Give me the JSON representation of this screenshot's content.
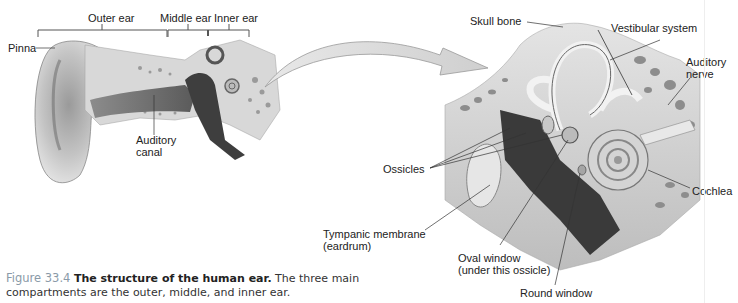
{
  "figure": {
    "number_label": "Figure 33.4",
    "title": "The structure of the human ear.",
    "description": "The three main compartments are the outer, middle, and inner ear."
  },
  "left_panel": {
    "compartments": [
      {
        "label": "Outer ear"
      },
      {
        "label": "Middle ear"
      },
      {
        "label": "Inner ear"
      }
    ],
    "labels": {
      "pinna": "Pinna",
      "auditory_canal_line1": "Auditory",
      "auditory_canal_line2": "canal"
    }
  },
  "right_panel": {
    "labels": {
      "skull_bone": "Skull bone",
      "vestibular_system": "Vestibular system",
      "auditory_nerve_line1": "Auditory",
      "auditory_nerve_line2": "nerve",
      "ossicles": "Ossicles",
      "cochlea": "Cochlea",
      "tympanic_line1": "Tympanic membrane",
      "tympanic_line2": "(eardrum)",
      "oval_window_line1": "Oval window",
      "oval_window_line2": "(under this ossicle)",
      "round_window": "Round window"
    }
  },
  "icons": {
    "zoom_arrow": "curved-arrow-icon"
  },
  "colors": {
    "tissue_light": "#d9d9d9",
    "tissue_mid": "#a8a8a8",
    "tissue_dark": "#4a4a4a",
    "bone": "#cfcfcf",
    "caption_figure": "#8a9aa8"
  }
}
